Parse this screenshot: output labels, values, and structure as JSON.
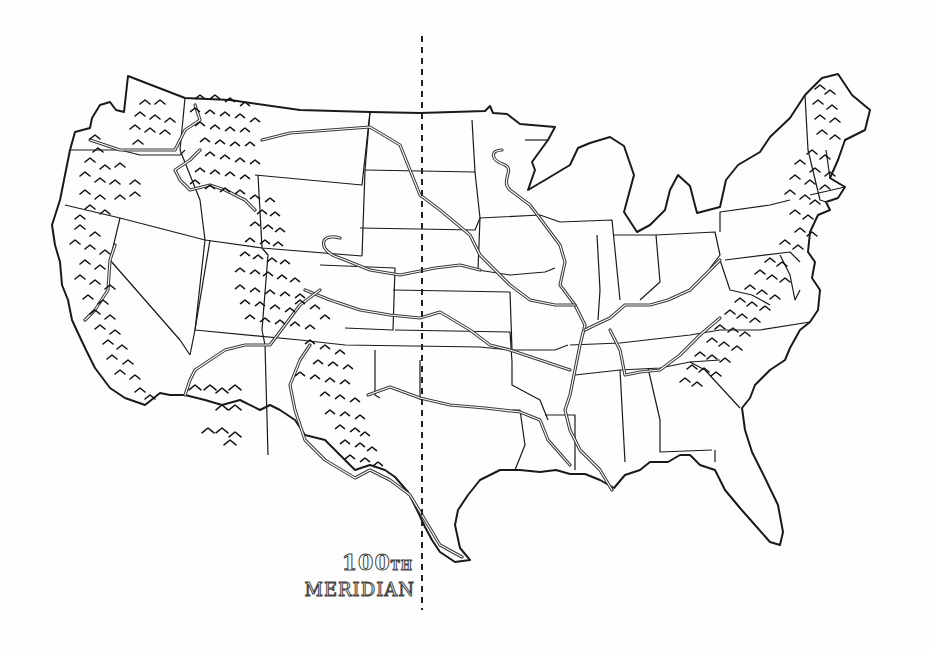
{
  "map": {
    "title": "United States — 100th Meridian",
    "style": "hand-drawn black and white outline map",
    "colors": {
      "background": "#fefefe",
      "ink": "#1a1a1a",
      "river": "#3a3a3a"
    },
    "meridian_label": {
      "number": "100",
      "suffix": "TH",
      "word": "MERIDIAN"
    },
    "features": [
      "contiguous US state borders",
      "major rivers (Mississippi, Missouri, Ohio, Arkansas, Red, Rio Grande, Snake, Columbia, Platte, Colorado, Tennessee)",
      "mountain ranges marked with chevron symbols (Cascades, Sierra Nevada, Rocky Mountains, Appalachians, Arizona ranges)",
      "dashed line marking the 100th meridian"
    ]
  }
}
